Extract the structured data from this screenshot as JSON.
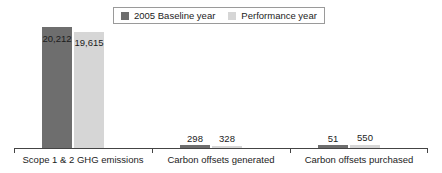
{
  "chart_data": {
    "type": "bar",
    "title": "",
    "subtitle": "",
    "xlabel": "",
    "ylabel": "",
    "grid": false,
    "legend_position": "top-center",
    "ylim": [
      0,
      20212
    ],
    "categories": [
      "Scope 1 & 2 GHG emissions",
      "Carbon offsets generated",
      "Carbon offsets purchased"
    ],
    "series": [
      {
        "name": "2005 Baseline year",
        "color": "#6e6e6e",
        "values": [
          20212,
          298,
          51
        ],
        "labels": [
          "20,212",
          "298",
          "51"
        ]
      },
      {
        "name": "Performance year",
        "color": "#d6d6d6",
        "values": [
          19615,
          328,
          550
        ],
        "labels": [
          "19,615",
          "328",
          "550"
        ]
      }
    ]
  },
  "legend": {
    "entries": [
      {
        "label": "2005 Baseline year",
        "color": "#6e6e6e"
      },
      {
        "label": "Performance year",
        "color": "#d6d6d6"
      }
    ]
  },
  "colors": {
    "baseline": "#6e6e6e",
    "performance": "#d6d6d6",
    "axis": "#444444",
    "text": "#1c1c1c",
    "background": "#ffffff"
  }
}
